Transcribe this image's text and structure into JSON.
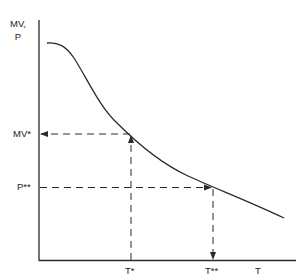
{
  "diagram": {
    "y_axis_label_line1": "MV,",
    "y_axis_label_line2": "P",
    "x_axis_label": "T",
    "y_markers": [
      {
        "label": "MV*",
        "y": 134
      },
      {
        "label": "P**",
        "y": 187
      }
    ],
    "x_markers": [
      {
        "label": "T*",
        "x": 131
      },
      {
        "label": "T**",
        "x": 213
      }
    ],
    "curve": {
      "description": "downward-sloping convex curve",
      "start": [
        47,
        43
      ],
      "end": [
        284,
        218
      ]
    },
    "colors": {
      "line": "#2a2a2a",
      "background": "#ffffff"
    }
  }
}
